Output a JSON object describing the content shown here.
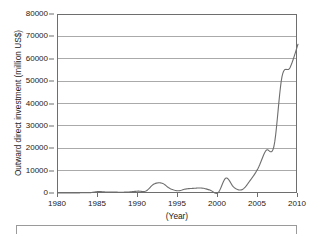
{
  "chart_data": {
    "type": "line",
    "title": "",
    "xlabel": "(Year)",
    "ylabel": "Outward direct investment (million US$)",
    "xlim": [
      1980,
      2010
    ],
    "ylim": [
      0,
      80000
    ],
    "grid": true,
    "legend": "none",
    "y_ticks": [
      0,
      10000,
      20000,
      30000,
      40000,
      50000,
      60000,
      70000,
      80000
    ],
    "y_tick_labels": [
      "0",
      "10000",
      "20000",
      "30000",
      "40000",
      "50000",
      "60000",
      "70000",
      "80000"
    ],
    "x_ticks": [
      1980,
      1985,
      1990,
      1995,
      2000,
      2005,
      2010
    ],
    "x_tick_labels": [
      "1980",
      "1985",
      "1990",
      "1995",
      "2000",
      "2005",
      "2010"
    ],
    "series": [
      {
        "name": "Outward direct investment",
        "color": "#6e6e6e",
        "x": [
          1980,
          1981,
          1982,
          1983,
          1984,
          1985,
          1986,
          1987,
          1988,
          1989,
          1990,
          1991,
          1992,
          1993,
          1994,
          1995,
          1996,
          1997,
          1998,
          1999,
          2000,
          2001,
          2002,
          2003,
          2004,
          2005,
          2006,
          2007,
          2008,
          2009,
          2010
        ],
        "values": [
          0,
          10,
          40,
          90,
          130,
          630,
          450,
          410,
          350,
          500,
          830,
          900,
          4000,
          4400,
          2000,
          1000,
          1800,
          2100,
          2200,
          1300,
          100,
          6700,
          2500,
          1500,
          5500,
          11000,
          19000,
          21000,
          52000,
          56000,
          66500
        ]
      }
    ]
  },
  "figure": {
    "legend_box_visible": true
  }
}
